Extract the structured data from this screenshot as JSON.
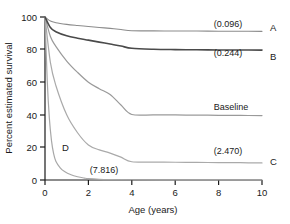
{
  "chart_data": {
    "type": "line",
    "title": "",
    "xlabel": "Age (years)",
    "ylabel": "Percent estimated survival",
    "xlim": [
      0,
      10
    ],
    "ylim": [
      0,
      100
    ],
    "xticks": [
      "0",
      "2",
      "4",
      "6",
      "8",
      "10"
    ],
    "yticks": [
      "0",
      "20",
      "40",
      "60",
      "80",
      "100"
    ],
    "grid": false,
    "legend_position": "right-of-plot-inline",
    "series": [
      {
        "name": "A",
        "letter": "A",
        "annotation": "(0.096)",
        "color": "#8c8c8c",
        "width": 1.1,
        "x": [
          0,
          0.25,
          0.5,
          1,
          1.5,
          2,
          2.5,
          3,
          3.5,
          4,
          5,
          6,
          7,
          8,
          9,
          10
        ],
        "y": [
          100,
          97.5,
          96.5,
          95.5,
          94.8,
          94.2,
          93.6,
          93.0,
          92.3,
          91.6,
          91.5,
          91.4,
          91.4,
          91.3,
          91.3,
          91.2
        ]
      },
      {
        "name": "B",
        "letter": "B",
        "annotation": "(0.244)",
        "color": "#4a4a4a",
        "width": 1.6,
        "x": [
          0,
          0.25,
          0.5,
          1,
          1.5,
          2,
          2.5,
          3,
          3.5,
          4,
          5,
          6,
          7,
          8,
          9,
          10
        ],
        "y": [
          100,
          93.5,
          91.0,
          88.5,
          87.0,
          85.8,
          84.6,
          83.4,
          82.2,
          80.8,
          80.2,
          80.0,
          79.9,
          79.8,
          79.8,
          79.7
        ]
      },
      {
        "name": "Baseline",
        "letter": "",
        "annotation": "Baseline",
        "color": "#9a9a9a",
        "width": 1.2,
        "x": [
          0,
          0.25,
          0.5,
          1,
          1.5,
          2,
          2.5,
          3,
          3.5,
          4,
          5,
          6,
          7,
          8,
          9,
          10
        ],
        "y": [
          100,
          88,
          82,
          73,
          66,
          60,
          56,
          52.5,
          46,
          40.2,
          40.0,
          39.9,
          39.8,
          39.7,
          39.6,
          39.5
        ]
      },
      {
        "name": "C",
        "letter": "C",
        "annotation": "(2.470)",
        "color": "#aaaaaa",
        "width": 1.2,
        "x": [
          0,
          0.25,
          0.5,
          1,
          1.5,
          2,
          2.5,
          3,
          3.5,
          4,
          5,
          6,
          7,
          8,
          9,
          10
        ],
        "y": [
          100,
          72,
          58,
          40,
          29,
          21.5,
          18.5,
          16.5,
          14.0,
          11.2,
          11.0,
          10.9,
          10.8,
          10.7,
          10.6,
          10.5
        ]
      },
      {
        "name": "D",
        "letter": "D",
        "annotation": "(7.816)",
        "color": "#a8a8a8",
        "width": 1.2,
        "x": [
          0,
          0.1,
          0.2,
          0.3,
          0.4,
          0.5,
          0.7,
          0.9,
          1.2,
          1.5,
          1.8,
          2,
          2.5,
          3,
          4,
          6,
          8,
          10
        ],
        "y": [
          100,
          62,
          38,
          24,
          16,
          11.5,
          7.5,
          5.2,
          3.2,
          2.0,
          1.2,
          0.8,
          0.4,
          0.25,
          0.15,
          0.1,
          0.1,
          0.1
        ]
      }
    ],
    "annotations": [
      {
        "text": "(0.096)",
        "series": "A"
      },
      {
        "text": "(0.244)",
        "series": "B"
      },
      {
        "text": "Baseline",
        "series": "Baseline"
      },
      {
        "text": "(2.470)",
        "series": "C"
      },
      {
        "text": "(7.816)",
        "series": "D"
      },
      {
        "text": "D",
        "series": "D"
      }
    ]
  },
  "axis": {
    "x_title": "Age (years)",
    "y_title": "Percent estimated survival",
    "x_ticks": [
      "0",
      "2",
      "4",
      "6",
      "8",
      "10"
    ],
    "y_ticks": [
      "100",
      "80",
      "60",
      "40",
      "20",
      "0"
    ]
  },
  "labels": {
    "a_letter": "A",
    "b_letter": "B",
    "c_letter": "C",
    "d_letter": "D",
    "a_value": "(0.096)",
    "b_value": "(0.244)",
    "baseline_text": "Baseline",
    "c_value": "(2.470)",
    "d_value": "(7.816)"
  },
  "colors": {
    "axis": "#1a1a1a",
    "curve_a": "#8c8c8c",
    "curve_b": "#4a4a4a",
    "curve_baseline": "#9a9a9a",
    "curve_c": "#aaaaaa",
    "curve_d": "#a8a8a8",
    "background": "#ffffff"
  }
}
